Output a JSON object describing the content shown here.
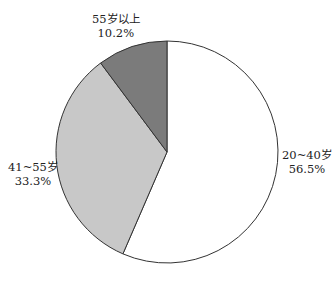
{
  "chart_data": {
    "type": "pie",
    "title": "",
    "slices": [
      {
        "label": "20~40岁",
        "value": 56.5,
        "pct_label": "56.5%",
        "color": "#ffffff"
      },
      {
        "label": "41~55岁",
        "value": 33.3,
        "pct_label": "33.3%",
        "color": "#c8c8c8"
      },
      {
        "label": "55岁以上",
        "value": 10.2,
        "pct_label": "10.2%",
        "color": "#7b7b7b"
      }
    ],
    "start_angle_deg": 0,
    "direction": "clockwise",
    "legend": "none"
  },
  "labels": {
    "s0": {
      "name": "20~40岁",
      "pct": "56.5%"
    },
    "s1": {
      "name": "41~55岁",
      "pct": "33.3%"
    },
    "s2": {
      "name": "55岁以上",
      "pct": "10.2%"
    }
  }
}
